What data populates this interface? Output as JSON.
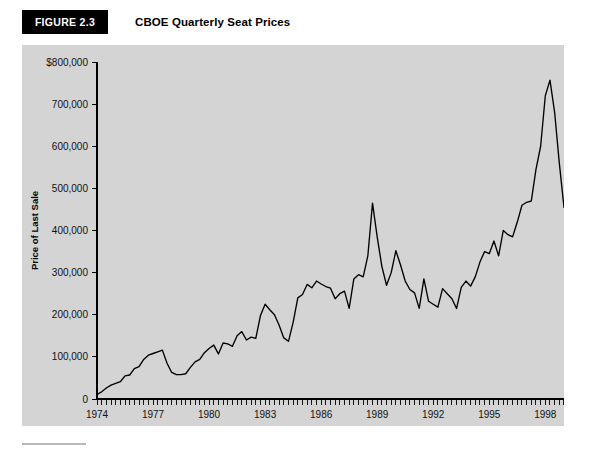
{
  "header": {
    "badge_label": "FIGURE 2.3",
    "title": "CBOE Quarterly Seat Prices"
  },
  "colors": {
    "panel_background": "#d4d4d4",
    "badge_background": "#000000",
    "badge_text": "#ffffff",
    "line": "#000000",
    "axis": "#000000",
    "page_background": "#ffffff"
  },
  "chart_data": {
    "type": "line",
    "title": "CBOE Quarterly Seat Prices",
    "xlabel": "Quarter",
    "ylabel": "Price of Last Sale",
    "grid": false,
    "legend": null,
    "xlim": [
      1974.0,
      1999.75
    ],
    "ylim": [
      0,
      800000
    ],
    "y_ticks": [
      0,
      100000,
      200000,
      300000,
      400000,
      500000,
      600000,
      700000,
      800000
    ],
    "y_tick_labels": [
      "0",
      "100,000",
      "200,000",
      "300,000",
      "400,000",
      "500,000",
      "600,000",
      "700,000",
      "$800,000"
    ],
    "x_ticks": [
      1974,
      1977,
      1980,
      1983,
      1986,
      1989,
      1992,
      1995,
      1998
    ],
    "x_tick_labels": [
      "1974",
      "1977",
      "1980",
      "1983",
      "1986",
      "1989",
      "1992",
      "1995",
      "1998"
    ],
    "x_minor_tick_interval": 0.25,
    "series": [
      {
        "name": "Price of Last Sale",
        "x": [
          1974.0,
          1974.25,
          1974.5,
          1974.75,
          1975.0,
          1975.25,
          1975.5,
          1975.75,
          1976.0,
          1976.25,
          1976.5,
          1976.75,
          1977.0,
          1977.25,
          1977.5,
          1977.75,
          1978.0,
          1978.25,
          1978.5,
          1978.75,
          1979.0,
          1979.25,
          1979.5,
          1979.75,
          1980.0,
          1980.25,
          1980.5,
          1980.75,
          1981.0,
          1981.25,
          1981.5,
          1981.75,
          1982.0,
          1982.25,
          1982.5,
          1982.75,
          1983.0,
          1983.25,
          1983.5,
          1983.75,
          1984.0,
          1984.25,
          1984.5,
          1984.75,
          1985.0,
          1985.25,
          1985.5,
          1985.75,
          1986.0,
          1986.25,
          1986.5,
          1986.75,
          1987.0,
          1987.25,
          1987.5,
          1987.75,
          1988.0,
          1988.25,
          1988.5,
          1988.75,
          1989.0,
          1989.25,
          1989.5,
          1989.75,
          1990.0,
          1990.25,
          1990.5,
          1990.75,
          1991.0,
          1991.25,
          1991.5,
          1991.75,
          1992.0,
          1992.25,
          1992.5,
          1992.75,
          1993.0,
          1993.25,
          1993.5,
          1993.75,
          1994.0,
          1994.25,
          1994.5,
          1994.75,
          1995.0,
          1995.25,
          1995.5,
          1995.75,
          1996.0,
          1996.25,
          1996.5,
          1996.75,
          1997.0,
          1997.25,
          1997.5,
          1997.75,
          1998.0,
          1998.25,
          1998.5,
          1998.75,
          1999.0,
          1999.25,
          1999.5,
          1999.75
        ],
        "values": [
          11000,
          17000,
          26000,
          33000,
          37000,
          41000,
          55000,
          57000,
          72000,
          77000,
          94000,
          104000,
          108000,
          112000,
          116000,
          85000,
          63000,
          58000,
          58000,
          60000,
          75000,
          88000,
          94000,
          110000,
          120000,
          128000,
          107000,
          133000,
          131000,
          125000,
          150000,
          160000,
          140000,
          147000,
          144000,
          198000,
          225000,
          212000,
          200000,
          175000,
          145000,
          137000,
          182000,
          240000,
          248000,
          272000,
          264000,
          280000,
          273000,
          267000,
          263000,
          238000,
          250000,
          256000,
          215000,
          285000,
          295000,
          290000,
          340000,
          465000,
          385000,
          315000,
          270000,
          300000,
          352000,
          318000,
          280000,
          260000,
          252000,
          215000,
          285000,
          232000,
          225000,
          218000,
          262000,
          250000,
          238000,
          215000,
          265000,
          280000,
          268000,
          290000,
          325000,
          350000,
          345000,
          375000,
          340000,
          400000,
          390000,
          385000,
          420000,
          460000,
          467000,
          470000,
          545000,
          600000,
          720000,
          757000,
          680000,
          560000,
          455000,
          600000,
          715000,
          455000
        ]
      }
    ]
  },
  "axis": {
    "y_label": "Price of Last Sale",
    "x_label": "Quarter"
  }
}
